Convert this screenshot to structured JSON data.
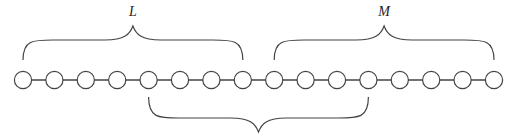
{
  "diagram": {
    "node_count": 16,
    "node_spacing": 31.4,
    "first_node_x": 23,
    "node_y": 80,
    "node_radius": 8.6,
    "stroke_color": "#444444",
    "node_fill": "#ffffff",
    "braces": [
      {
        "label": "L",
        "position": "top",
        "from_node": 1,
        "to_node": 8
      },
      {
        "label": "M",
        "position": "top",
        "from_node": 9,
        "to_node": 16
      },
      {
        "label": "",
        "position": "bottom",
        "from_node": 5,
        "to_node": 12
      }
    ]
  }
}
